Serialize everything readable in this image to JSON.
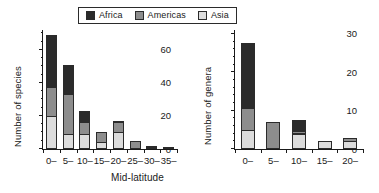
{
  "figure": {
    "xlabel": "Mid-latitude",
    "legend": {
      "position": "top-center",
      "entries": [
        {
          "name": "Africa",
          "color": "#2b2b2b"
        },
        {
          "name": "Americas",
          "color": "#8d8d8d"
        },
        {
          "name": "Asia",
          "color": "#dcdcdc"
        }
      ]
    }
  },
  "chart_data": [
    {
      "type": "bar",
      "subtype": "stacked",
      "title": "",
      "panel": "left",
      "xlabel": "Mid-latitude",
      "ylabel": "Number of species",
      "categories": [
        "0–",
        "5–",
        "10–",
        "15–",
        "20–",
        "25–",
        "30–",
        "35–"
      ],
      "series": [
        {
          "name": "Asia",
          "color": "#dcdcdc",
          "values": [
            20,
            9,
            9,
            4,
            10,
            0,
            1,
            1
          ]
        },
        {
          "name": "Americas",
          "color": "#8d8d8d",
          "values": [
            18,
            25,
            8,
            7,
            7,
            5,
            1,
            0
          ]
        },
        {
          "name": "Africa",
          "color": "#2b2b2b",
          "values": [
            32,
            18,
            7,
            0,
            1,
            0,
            0,
            0
          ]
        }
      ],
      "totals": [
        70,
        52,
        24,
        11,
        18,
        5,
        2,
        1
      ],
      "ylim": [
        0,
        72
      ],
      "yticks": [
        0,
        20,
        40,
        60
      ],
      "yticks_minor": [
        5,
        10,
        15,
        25,
        30,
        35,
        45,
        50,
        55,
        65,
        70
      ],
      "grid": false
    },
    {
      "type": "bar",
      "subtype": "stacked",
      "title": "",
      "panel": "right",
      "xlabel": "Mid-latitude",
      "ylabel": "Number of genera",
      "categories": [
        "0–",
        "5–",
        "10–",
        "15–",
        "20–"
      ],
      "series": [
        {
          "name": "Asia",
          "color": "#dcdcdc",
          "values": [
            5,
            0,
            4,
            2,
            2
          ]
        },
        {
          "name": "Americas",
          "color": "#8d8d8d",
          "values": [
            6,
            7,
            1,
            0,
            1
          ]
        },
        {
          "name": "Africa",
          "color": "#2b2b2b",
          "values": [
            17,
            0,
            3,
            0,
            0
          ]
        }
      ],
      "totals": [
        28,
        7,
        8,
        2,
        3
      ],
      "ylim": [
        0,
        31
      ],
      "yticks": [
        0,
        10,
        20,
        30
      ],
      "yticks_minor": [
        2,
        4,
        6,
        8,
        12,
        14,
        16,
        18,
        22,
        24,
        26,
        28
      ],
      "grid": false
    }
  ]
}
